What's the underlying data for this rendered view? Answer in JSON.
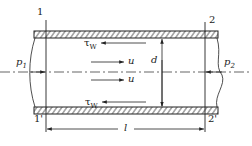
{
  "diagram": {
    "sections": {
      "top_left": "1",
      "bottom_left": "1'",
      "top_right": "2",
      "bottom_right": "2'"
    },
    "pressures": {
      "left": {
        "symbol": "p",
        "sub": "1"
      },
      "right": {
        "symbol": "p",
        "sub": "2"
      }
    },
    "shear_stress": {
      "symbol": "τ",
      "sub": "W"
    },
    "velocity": "u",
    "diameter": "d",
    "length": "l",
    "colors": {
      "line": "#222222",
      "background": "#ffffff"
    }
  }
}
